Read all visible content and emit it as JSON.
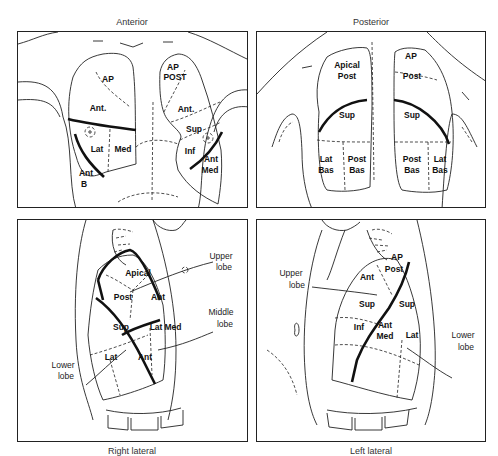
{
  "figure": {
    "panels": [
      {
        "id": "anterior",
        "caption": "Anterior",
        "segments": [
          "AP",
          "Ant.",
          "Lat",
          "Med",
          "Ant",
          "B",
          "AP",
          "POST",
          "Ant.",
          "Sup",
          "Inf",
          "Ant",
          "Med"
        ]
      },
      {
        "id": "posterior",
        "caption": "Posterior",
        "segments": [
          "Apical",
          "Post",
          "Sup",
          "Lat",
          "Bas",
          "Post",
          "Bas",
          "AP",
          "Post",
          "Sup",
          "Post",
          "Bas",
          "Lat",
          "Bas"
        ]
      },
      {
        "id": "right-lateral",
        "caption": "Right lateral",
        "segments": [
          "Apical",
          "Post",
          "Ant",
          "Sup",
          "Lat",
          "Med",
          "Lat",
          "Ant"
        ],
        "callouts": [
          "Upper",
          "lobe",
          "Middle",
          "lobe",
          "Lower",
          "lobe"
        ]
      },
      {
        "id": "left-lateral",
        "caption": "Left lateral",
        "segments": [
          "AP",
          "Post",
          "Ant",
          "Sup",
          "Sup",
          "Inf",
          "Ant",
          "Med",
          "Lat"
        ],
        "callouts": [
          "Upper",
          "lobe",
          "Lower",
          "lobe"
        ]
      }
    ]
  }
}
